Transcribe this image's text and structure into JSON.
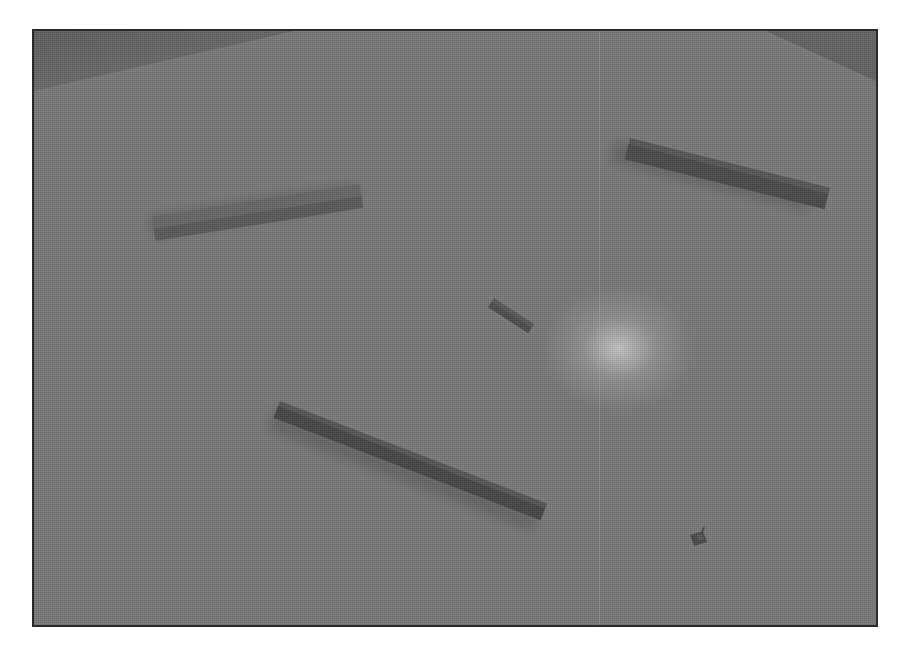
{
  "scene": {
    "type": "3d-top-down-arena",
    "ground_color": "#7a7a7a",
    "frame_color": "#2a2a2a",
    "light_spot": {
      "x": 618,
      "y": 348,
      "color": "#d2d2d2"
    },
    "walls": [
      {
        "name": "wall-left-upper",
        "x1": 150,
        "y1": 222,
        "x2": 357,
        "y2": 190,
        "thickness": 18,
        "color": "#5c5c5c"
      },
      {
        "name": "wall-right-upper",
        "x1": 628,
        "y1": 140,
        "x2": 828,
        "y2": 190,
        "thickness": 20,
        "color": "#4a4a4a"
      },
      {
        "name": "wall-center-small",
        "x1": 490,
        "y1": 300,
        "x2": 532,
        "y2": 326,
        "thickness": 8,
        "color": "#505050"
      },
      {
        "name": "wall-lower-long",
        "x1": 277,
        "y1": 403,
        "x2": 545,
        "y2": 505,
        "thickness": 16,
        "color": "#474747"
      }
    ],
    "tank": {
      "x": 700,
      "y": 540,
      "color": "#4e4e4e"
    }
  }
}
